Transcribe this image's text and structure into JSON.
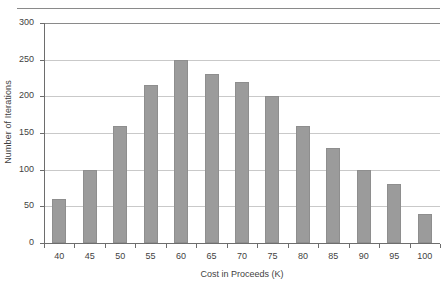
{
  "chart_data": {
    "type": "bar",
    "title": "",
    "subtitle": "",
    "xlabel": "Cost in Proceeds (K)",
    "ylabel": "Number of Iterations",
    "categories": [
      "40",
      "45",
      "50",
      "55",
      "60",
      "65",
      "70",
      "75",
      "80",
      "85",
      "90",
      "95",
      "100"
    ],
    "values": [
      60,
      100,
      160,
      215,
      250,
      230,
      220,
      200,
      160,
      130,
      100,
      80,
      40
    ],
    "ylim": [
      0,
      300
    ],
    "yticks": [
      0,
      50,
      100,
      150,
      200,
      250,
      300
    ],
    "ytick_labels": [
      "0",
      "50",
      "100",
      "150",
      "200",
      "250",
      "300"
    ],
    "grid": true,
    "grid_axis": "y",
    "legend": false,
    "legend_position": "none",
    "bar_color": "#9b9b9b",
    "grid_color": "#c9c9c9",
    "axis_color": "#6d6d6d",
    "text_color": "#3f3f3f",
    "background": "#ffffff"
  }
}
